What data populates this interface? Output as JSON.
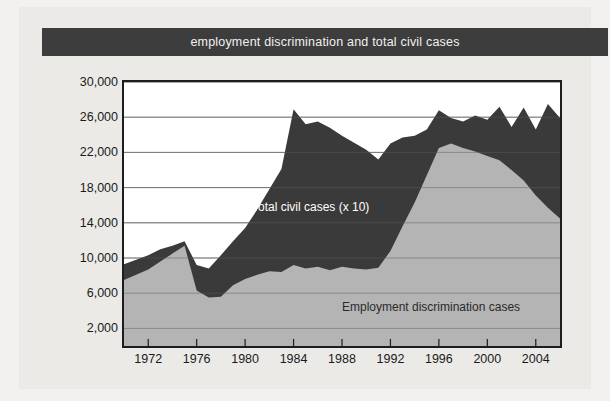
{
  "header": {
    "title": "employment discrimination and total civil cases"
  },
  "colors": {
    "page_background": "#f2f1ef",
    "card_background": "#ebeae7",
    "title_bar": "#3d3d3d",
    "title_text": "#f1f1f1",
    "plot_background": "#ffffff",
    "total_civil_area": "#3a3a3a",
    "employment_area": "#b4b4b4",
    "gridline": "#8d8d8d",
    "axis": "#1d1d1d",
    "axis_text": "#1a1a1a"
  },
  "axes": {
    "y_label": "",
    "y_ticks": [
      "2,000",
      "6,000",
      "10,000",
      "14,000",
      "18,000",
      "22,000",
      "26,000",
      "30,000"
    ],
    "y_tick_values": [
      2000,
      6000,
      10000,
      14000,
      18000,
      22000,
      26000,
      30000
    ],
    "y_min": 0,
    "y_max": 30000,
    "x_label": "",
    "x_ticks": [
      "1972",
      "1976",
      "1980",
      "1984",
      "1988",
      "1992",
      "1996",
      "2000",
      "2004"
    ],
    "x_tick_values": [
      1972,
      1976,
      1980,
      1984,
      1988,
      1992,
      1996,
      2000,
      2004
    ],
    "x_min": 1970,
    "x_max": 2006,
    "grid": true
  },
  "labels": {
    "total_civil": "Total civil cases (x 10)",
    "employment": "Employment discrimination cases"
  },
  "chart_data": {
    "type": "area",
    "title": "employment discrimination and total civil cases",
    "xlabel": "",
    "ylabel": "",
    "xlim": [
      1970,
      2006
    ],
    "ylim": [
      0,
      30000
    ],
    "grid": true,
    "legend": "in-plot labels",
    "stacking": "overlaid",
    "x": [
      1970,
      1971,
      1972,
      1973,
      1974,
      1975,
      1976,
      1977,
      1978,
      1979,
      1980,
      1981,
      1982,
      1983,
      1984,
      1985,
      1986,
      1987,
      1988,
      1989,
      1990,
      1991,
      1992,
      1993,
      1994,
      1995,
      1996,
      1997,
      1998,
      1999,
      2000,
      2001,
      2002,
      2003,
      2004,
      2005,
      2006
    ],
    "series": [
      {
        "name": "Total civil cases (x 10)",
        "color": "#3a3a3a",
        "values": [
          9300,
          9800,
          10300,
          11000,
          11400,
          11900,
          9200,
          8800,
          10300,
          11900,
          13400,
          15500,
          17800,
          20100,
          26900,
          25200,
          25500,
          24800,
          23900,
          23100,
          22300,
          21200,
          23000,
          23700,
          23900,
          24600,
          26800,
          25900,
          25500,
          26200,
          25700,
          27200,
          24900,
          27100,
          24600,
          27500,
          25900
        ]
      },
      {
        "name": "Employment discrimination cases",
        "color": "#b4b4b4",
        "values": [
          7500,
          8100,
          8700,
          9600,
          10500,
          11400,
          6300,
          5500,
          5600,
          6900,
          7600,
          8100,
          8500,
          8400,
          9200,
          8800,
          9000,
          8600,
          9000,
          8800,
          8700,
          8900,
          10800,
          13600,
          16300,
          19400,
          22500,
          23000,
          22500,
          22100,
          21600,
          21100,
          20000,
          18800,
          17100,
          15700,
          14500
        ]
      }
    ]
  }
}
